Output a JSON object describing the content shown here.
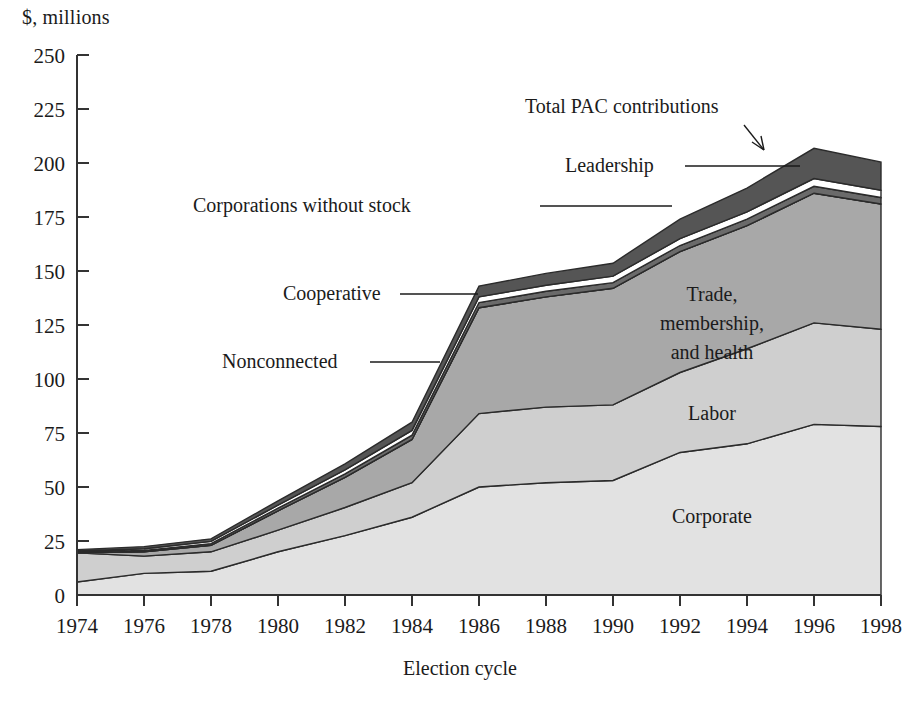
{
  "chart_data": {
    "type": "area",
    "stacked": true,
    "title": "",
    "subtitle": "",
    "ylabel": "$, millions",
    "xlabel": "Election cycle",
    "grid": false,
    "legend_position": "inline-annotations",
    "xlim": [
      1974,
      1998
    ],
    "ylim": [
      0,
      250
    ],
    "ytick_step": 25,
    "categories": [
      1974,
      1976,
      1978,
      1980,
      1982,
      1984,
      1986,
      1988,
      1990,
      1992,
      1994,
      1996,
      1998
    ],
    "xtick_labels": [
      "1974",
      "1976",
      "1978",
      "1980",
      "1982",
      "1984",
      "1986",
      "1988",
      "1990",
      "1992",
      "1994",
      "1996",
      "1998"
    ],
    "ytick_labels": [
      "0",
      "25",
      "50",
      "75",
      "100",
      "125",
      "150",
      "175",
      "200",
      "225",
      "250"
    ],
    "series": [
      {
        "name": "Corporate",
        "label": "Corporate",
        "color": "#e2e2e2",
        "values": [
          6.0,
          10.0,
          11.0,
          20.0,
          27.5,
          36.0,
          50.0,
          52.0,
          53.0,
          66.0,
          70.0,
          79.0,
          78.0
        ]
      },
      {
        "name": "Labor",
        "label": "Labor",
        "color": "#cfcfcf",
        "values": [
          13.5,
          8.0,
          9.0,
          10.0,
          13.0,
          16.0,
          34.0,
          35.0,
          35.0,
          37.0,
          44.0,
          47.0,
          45.0
        ]
      },
      {
        "name": "Trade, membership, and health",
        "label": "Trade,\nmembership,\nand health",
        "color": "#a8a8a8",
        "values": [
          0.0,
          2.0,
          3.0,
          9.0,
          14.0,
          20.0,
          49.0,
          51.0,
          54.0,
          56.0,
          57.0,
          60.0,
          58.0
        ]
      },
      {
        "name": "Nonconnected",
        "label": "Nonconnected",
        "color": "#7d7d7d",
        "values": [
          0.0,
          0.0,
          0.0,
          0.0,
          0.0,
          0.0,
          0.0,
          0.0,
          0.0,
          0.0,
          0.0,
          0.0,
          0.0
        ]
      },
      {
        "name": "Cooperative",
        "label": "Cooperative",
        "color": "#6a6a6a",
        "values": [
          0.4,
          0.6,
          0.8,
          1.2,
          1.6,
          2.0,
          2.4,
          2.6,
          2.6,
          2.8,
          3.0,
          3.2,
          3.0
        ]
      },
      {
        "name": "Corporations without stock",
        "label": "Corporations without stock",
        "color": "#ffffff",
        "values": [
          0.5,
          0.8,
          1.0,
          1.4,
          1.8,
          2.2,
          2.6,
          2.8,
          3.0,
          3.2,
          3.4,
          3.6,
          3.4
        ]
      },
      {
        "name": "Leadership",
        "label": "Leadership",
        "color": "#555555",
        "values": [
          0.6,
          1.0,
          1.2,
          2.0,
          2.8,
          3.8,
          5.0,
          5.5,
          6.0,
          9.0,
          11.0,
          14.0,
          13.0
        ]
      }
    ],
    "totals": {
      "name": "Total PAC contributions",
      "label": "Total PAC contributions",
      "values": [
        13.5,
        22.4,
        26.0,
        43.6,
        60.7,
        80.0,
        138.0,
        143.0,
        145.0,
        178.0,
        189.0,
        228.0,
        219.0
      ]
    },
    "annotations": [
      {
        "name": "total-pac-contributions",
        "text": "Total PAC contributions",
        "x": 525,
        "y": 113,
        "pointer": "arrow"
      },
      {
        "name": "leadership",
        "text": "Leadership",
        "x": 565,
        "y": 172,
        "pointer": "line"
      },
      {
        "name": "corporations-without-stock",
        "text": "Corporations without stock",
        "x": 193,
        "y": 212,
        "pointer": "line"
      },
      {
        "name": "cooperative",
        "text": "Cooperative",
        "x": 283,
        "y": 300,
        "pointer": "line"
      },
      {
        "name": "nonconnected",
        "text": "Nonconnected",
        "x": 222,
        "y": 368,
        "pointer": "line"
      },
      {
        "name": "trade-membership-and-health",
        "text": "Trade, membership, and health",
        "x": 660,
        "y": 300,
        "pointer": "none"
      },
      {
        "name": "labor",
        "text": "Labor",
        "x": 680,
        "y": 418,
        "pointer": "none"
      },
      {
        "name": "corporate",
        "text": "Corporate",
        "x": 665,
        "y": 522,
        "pointer": "none"
      }
    ]
  },
  "axes": {
    "y_title": "$, millions",
    "x_title": "Election cycle"
  },
  "colors": {
    "corporate": "#e2e2e2",
    "labor": "#cfcfcf",
    "trade": "#a8a8a8",
    "nonconnected": "#7d7d7d",
    "cooperative": "#6a6a6a",
    "corporations_without_stock": "#ffffff",
    "leadership": "#555555",
    "axis": "#333333",
    "outline": "#2b2b2b",
    "text": "#1b1b1b",
    "background": "#ffffff"
  },
  "labels": {
    "trade_line1": "Trade,",
    "trade_line2": "membership,",
    "trade_line3": "and health",
    "labor": "Labor",
    "corporate": "Corporate",
    "cooperative": "Cooperative",
    "nonconnected": "Nonconnected",
    "corporations_without_stock": "Corporations without stock",
    "leadership": "Leadership",
    "total": "Total PAC contributions"
  }
}
